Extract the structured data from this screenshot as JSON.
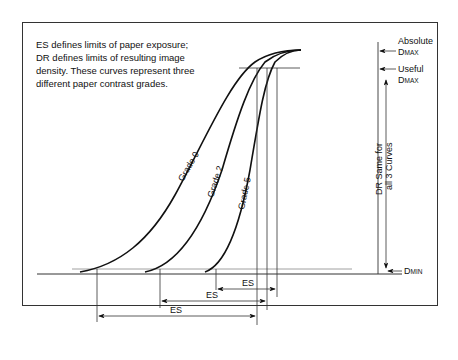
{
  "note": {
    "line1": "ES defines limits of paper exposure;",
    "line2": "DR defines limits of resulting image",
    "line3": "density. These curves represent three",
    "line4": "different paper contrast grades."
  },
  "curves": [
    {
      "label": "Grade 0"
    },
    {
      "label": "Grade 2"
    },
    {
      "label": "Grade 5"
    }
  ],
  "right_labels": {
    "absolute": "Absolute",
    "useful": "Useful",
    "d": "D",
    "max": "MAX",
    "min": "MIN",
    "dr_line1": "DR Same for",
    "dr_line2": "all 3 Curves"
  },
  "es_labels": [
    "ES",
    "ES",
    "ES"
  ]
}
